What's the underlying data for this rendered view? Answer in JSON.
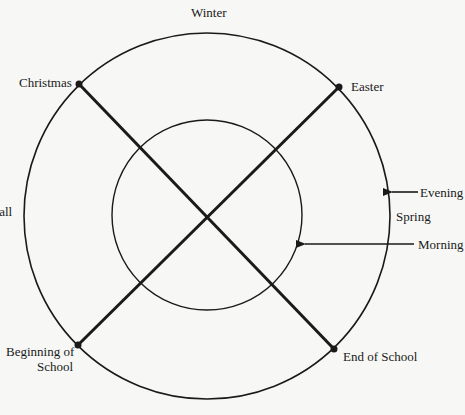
{
  "diagram": {
    "colors": {
      "background": "#f7f7f5",
      "ink": "#1a1a1a"
    },
    "circles": {
      "outer": {
        "label": "seasons / year cycle"
      },
      "inner": {
        "label": "day cycle"
      }
    },
    "season_labels": {
      "top": "Winter",
      "left": "Fall",
      "right": "Spring"
    },
    "event_points": {
      "christmas": "Christmas",
      "easter": "Easter",
      "beginning_of_school_line1": "Beginning of",
      "beginning_of_school_line2": "School",
      "end_of_school": "End of School"
    },
    "arrows": {
      "evening": "Evening",
      "morning": "Morning"
    }
  }
}
